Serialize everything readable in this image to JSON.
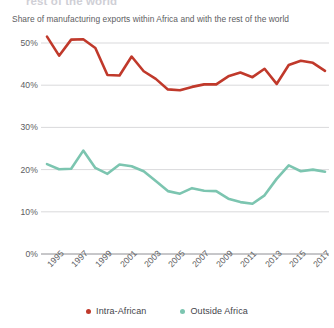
{
  "header": {
    "clipped_title": "rest of the world",
    "subtitle": "Share of manufacturing exports within Africa and with the rest of the world"
  },
  "legend": {
    "position": "bottom-center",
    "items": [
      {
        "label": "Intra-African",
        "color": "#c0392b",
        "icon": "legend-dot"
      },
      {
        "label": "Outside Africa",
        "color": "#7cc5b0",
        "icon": "legend-dot"
      }
    ]
  },
  "colors": {
    "intra_african": "#c0392b",
    "outside_africa": "#7cc5b0",
    "gridline": "#cfcfd2",
    "axis_text": "#5d5d62"
  },
  "chart_data": {
    "type": "line",
    "title": "",
    "subtitle": "Share of manufacturing exports within Africa and with the rest of the world",
    "xlabel": "",
    "ylabel": "",
    "ylim": [
      0,
      52
    ],
    "yticks": [
      0,
      10,
      20,
      30,
      40,
      50
    ],
    "ytick_labels": [
      "0%",
      "10%",
      "20%",
      "30%",
      "40%",
      "50%"
    ],
    "grid": true,
    "xlim": [
      1995,
      2018
    ],
    "xticks": [
      1995,
      1997,
      1999,
      2001,
      2003,
      2005,
      2007,
      2009,
      2011,
      2013,
      2015,
      2017
    ],
    "xtick_labels": [
      "1995",
      "1997",
      "1999",
      "2001",
      "2003",
      "2005",
      "2007",
      "2009",
      "2011",
      "2013",
      "2015",
      "2017"
    ],
    "xtick_rotation": -45,
    "x": [
      1995,
      1996,
      1997,
      1998,
      1999,
      2000,
      2001,
      2002,
      2003,
      2004,
      2005,
      2006,
      2007,
      2008,
      2009,
      2010,
      2011,
      2012,
      2013,
      2014,
      2015,
      2016,
      2017,
      2018
    ],
    "series": [
      {
        "name": "Intra-African",
        "color": "#c0392b",
        "values": [
          51.5,
          47.0,
          50.8,
          50.9,
          48.8,
          42.4,
          42.3,
          46.8,
          43.3,
          41.5,
          39.0,
          38.8,
          39.6,
          40.2,
          40.2,
          42.1,
          43.0,
          41.9,
          43.9,
          40.3,
          44.8,
          45.8,
          45.3,
          43.4
        ]
      },
      {
        "name": "Outside Africa",
        "color": "#7cc5b0",
        "values": [
          21.3,
          20.1,
          20.2,
          24.5,
          20.4,
          19.0,
          21.2,
          20.8,
          19.6,
          17.3,
          14.9,
          14.3,
          15.6,
          15.0,
          14.9,
          13.1,
          12.3,
          11.9,
          13.9,
          17.8,
          21.0,
          19.6,
          20.0,
          19.5
        ]
      }
    ]
  }
}
